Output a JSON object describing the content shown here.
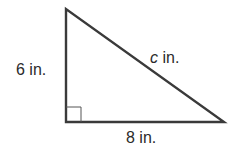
{
  "diagram": {
    "type": "right-triangle",
    "vertices": {
      "top": [
        66,
        9
      ],
      "right_angle": [
        66,
        122
      ],
      "right": [
        224,
        122
      ]
    },
    "stroke_color": "#3a3a3a",
    "labels": {
      "vertical_leg": "6 in.",
      "horizontal_leg": "8 in.",
      "hypotenuse_var": "c",
      "hypotenuse_unit": " in."
    },
    "right_angle_marker": true
  }
}
